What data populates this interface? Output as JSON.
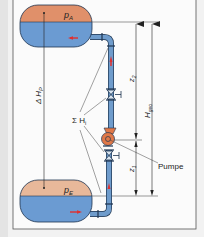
{
  "diagram": {
    "colors": {
      "gas": "#e0906a",
      "gas_light": "#e8b89a",
      "water": "#6b9bd2",
      "pipe": "#6f9ccc",
      "pump": "#e07848",
      "flow_arrow": "#e03030",
      "outline": "#1f3550",
      "frame": "#555555",
      "dim_line": "#333333"
    },
    "labels": {
      "upper_pressure": "p",
      "upper_pressure_sub": "A",
      "lower_pressure": "p",
      "lower_pressure_sub": "E",
      "delta_hp": "Δ H",
      "delta_hp_sub": "P",
      "sum_hi": "Σ H",
      "sum_hi_sub": "i",
      "z2": "z",
      "z2_sub": "2",
      "z1": "z",
      "z1_sub": "1",
      "hgeo": "H",
      "hgeo_sub": "geo",
      "pump": "Pumpe"
    },
    "components": [
      {
        "name": "upper-tank",
        "label": "pA"
      },
      {
        "name": "lower-tank",
        "label": "pE"
      },
      {
        "name": "pump",
        "label": "Pumpe"
      },
      {
        "name": "valve-upper"
      },
      {
        "name": "valve-lower"
      },
      {
        "name": "pipe"
      }
    ],
    "dimensions": [
      {
        "name": "z2",
        "from": "pump",
        "to": "upper-water-level"
      },
      {
        "name": "z1",
        "from": "lower-water-level",
        "to": "pump"
      },
      {
        "name": "Hgeo",
        "from": "lower-water-level",
        "to": "upper-water-level"
      },
      {
        "name": "ΔHp",
        "from": "lower-tank",
        "to": "upper-tank"
      }
    ]
  }
}
